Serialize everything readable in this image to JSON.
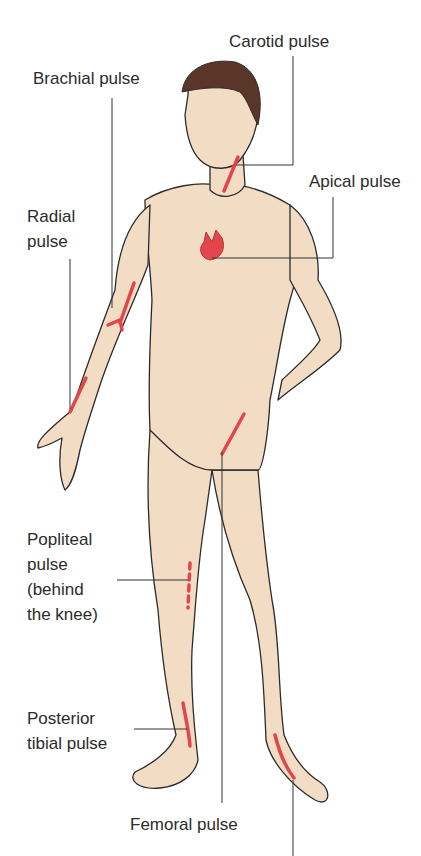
{
  "diagram": {
    "colors": {
      "skin": "#f3dcc4",
      "outline": "#2b2b2b",
      "hair": "#5a3628",
      "pulse_marker": "#e2454c",
      "leader_line": "#333333",
      "background": "#ffffff"
    },
    "labels": [
      {
        "id": "carotid",
        "text": "Carotid pulse"
      },
      {
        "id": "brachial",
        "text": "Brachial pulse"
      },
      {
        "id": "apical",
        "text": "Apical pulse"
      },
      {
        "id": "radial",
        "text": "Radial\npulse"
      },
      {
        "id": "popliteal",
        "text": "Popliteal\npulse\n(behind\nthe knee)"
      },
      {
        "id": "posterior_tibial",
        "text": "Posterior\ntibial pulse"
      },
      {
        "id": "femoral",
        "text": "Femoral pulse"
      }
    ]
  }
}
